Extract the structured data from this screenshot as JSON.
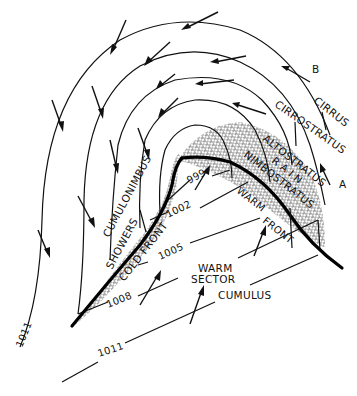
{
  "diagram": {
    "colors": {
      "ink": "#111111",
      "background": "#ffffff",
      "hatch": "#333333"
    },
    "isobars": [
      {
        "label": "999"
      },
      {
        "label": "1002"
      },
      {
        "label": "1005"
      },
      {
        "label": "1008"
      },
      {
        "label": "1011",
        "position": "left"
      },
      {
        "label": "1011",
        "position": "bottom"
      }
    ],
    "fronts": {
      "cold": "COLD FRONT",
      "warm": "WARM FRONT",
      "warm_line1": "WARM",
      "warm_line2": "FRONT"
    },
    "clouds": {
      "cirrus": "CIRRUS",
      "cirrostratus": "CIRROSTRATUS",
      "altostratus": "ALTOSTRATUS",
      "rain": "R A I N",
      "nimbostratus": "NIMBOSTRATUS",
      "cumulonimbus": "CUMULONIMBUS",
      "showers": "SHOWERS",
      "cumulus": "CUMULUS"
    },
    "sector": {
      "line1": "WARM",
      "line2": "SECTOR"
    },
    "points": {
      "a": "A",
      "b": "B"
    },
    "icons": [
      "wind-arrow-icon"
    ]
  }
}
